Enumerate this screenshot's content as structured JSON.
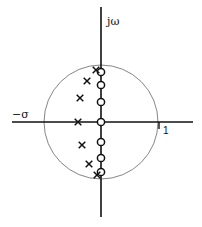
{
  "diagram": {
    "type": "pole-zero plot (s-plane)",
    "labels": {
      "imag_axis": "jω",
      "real_axis_neg": "−σ",
      "unit_tick": "1"
    },
    "colors": {
      "axis": "#111111",
      "circle": "#777777",
      "marker": "#111111"
    },
    "unit_circle": {
      "cx": 101,
      "cy": 122,
      "r": 57
    },
    "zeros": [
      {
        "x": 101,
        "y": 72
      },
      {
        "x": 101,
        "y": 85
      },
      {
        "x": 101,
        "y": 102
      },
      {
        "x": 101,
        "y": 122
      },
      {
        "x": 101,
        "y": 142
      },
      {
        "x": 101,
        "y": 158
      },
      {
        "x": 101,
        "y": 172
      }
    ],
    "poles": [
      {
        "x": 96,
        "y": 70
      },
      {
        "x": 87,
        "y": 81
      },
      {
        "x": 80,
        "y": 98
      },
      {
        "x": 78,
        "y": 122
      },
      {
        "x": 82,
        "y": 145
      },
      {
        "x": 89,
        "y": 164
      },
      {
        "x": 97,
        "y": 175
      }
    ]
  }
}
